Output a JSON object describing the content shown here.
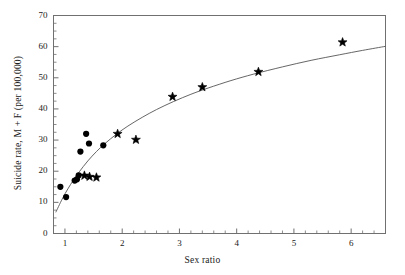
{
  "chart_data": {
    "type": "scatter",
    "title": "",
    "xlabel": "Sex ratio",
    "ylabel": "Suicide rate, M + F (per 100,000)",
    "xlim": [
      0.8,
      6.6
    ],
    "ylim": [
      0,
      70
    ],
    "xticks": [
      "1",
      "2",
      "3",
      "4",
      "5",
      "6"
    ],
    "xtick_values": [
      1,
      2,
      3,
      4,
      5,
      6
    ],
    "yticks": [
      "0",
      "10",
      "20",
      "30",
      "40",
      "50",
      "60",
      "70"
    ],
    "ytick_values": [
      0,
      10,
      20,
      30,
      40,
      50,
      60,
      70
    ],
    "x_minor_step": 0.2,
    "y_minor_step": 2.5,
    "grid": false,
    "legend": null,
    "frame": "box",
    "series": [
      {
        "name": "circle-markers",
        "marker": "circle",
        "color": "#000000",
        "points": [
          {
            "x": 0.92,
            "y": 15.0
          },
          {
            "x": 1.02,
            "y": 11.7
          },
          {
            "x": 1.17,
            "y": 17.0
          },
          {
            "x": 1.21,
            "y": 17.4
          },
          {
            "x": 1.24,
            "y": 18.7
          },
          {
            "x": 1.27,
            "y": 26.3
          },
          {
            "x": 1.37,
            "y": 32.0
          },
          {
            "x": 1.42,
            "y": 28.9
          },
          {
            "x": 1.67,
            "y": 28.3
          }
        ]
      },
      {
        "name": "star-markers",
        "marker": "star",
        "color": "#000000",
        "points": [
          {
            "x": 1.34,
            "y": 18.6
          },
          {
            "x": 1.43,
            "y": 18.2
          },
          {
            "x": 1.55,
            "y": 18.0
          },
          {
            "x": 1.92,
            "y": 32.0
          },
          {
            "x": 2.24,
            "y": 30.1
          },
          {
            "x": 2.88,
            "y": 43.9
          },
          {
            "x": 3.4,
            "y": 47.0
          },
          {
            "x": 4.38,
            "y": 51.9
          },
          {
            "x": 5.85,
            "y": 61.4
          }
        ]
      }
    ],
    "fit_curve": {
      "name": "fitted-curve",
      "color": "#555555",
      "points": [
        {
          "x": 0.84,
          "y": 6.8
        },
        {
          "x": 0.95,
          "y": 11.0
        },
        {
          "x": 1.05,
          "y": 14.3
        },
        {
          "x": 1.15,
          "y": 17.2
        },
        {
          "x": 1.25,
          "y": 19.8
        },
        {
          "x": 1.4,
          "y": 23.3
        },
        {
          "x": 1.55,
          "y": 26.3
        },
        {
          "x": 1.7,
          "y": 28.9
        },
        {
          "x": 1.9,
          "y": 31.9
        },
        {
          "x": 2.1,
          "y": 34.5
        },
        {
          "x": 2.35,
          "y": 37.3
        },
        {
          "x": 2.6,
          "y": 39.8
        },
        {
          "x": 2.9,
          "y": 42.4
        },
        {
          "x": 3.2,
          "y": 44.7
        },
        {
          "x": 3.5,
          "y": 46.7
        },
        {
          "x": 3.9,
          "y": 49.1
        },
        {
          "x": 4.3,
          "y": 51.2
        },
        {
          "x": 4.8,
          "y": 53.5
        },
        {
          "x": 5.3,
          "y": 55.6
        },
        {
          "x": 5.8,
          "y": 57.4
        },
        {
          "x": 6.2,
          "y": 58.8
        },
        {
          "x": 6.6,
          "y": 60.1
        }
      ]
    }
  }
}
